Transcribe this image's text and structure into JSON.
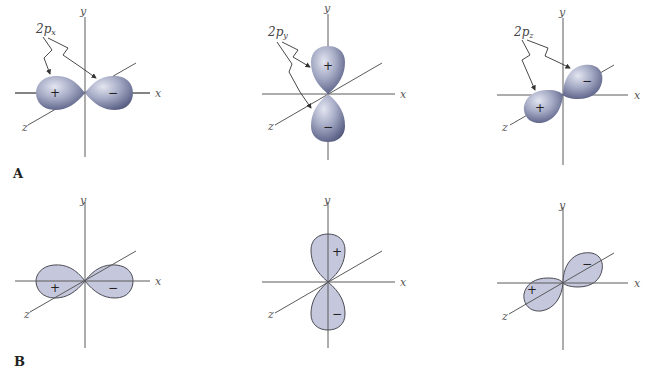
{
  "figure": {
    "rows": [
      {
        "label": "A",
        "style": "shaded-3d",
        "panels": [
          {
            "id": "px",
            "orbital_label": "2p",
            "orbital_sub": "x",
            "axes": {
              "x": "x",
              "y": "y",
              "z": "z"
            },
            "lobes": [
              {
                "sign": "+"
              },
              {
                "sign": "−"
              }
            ]
          },
          {
            "id": "py",
            "orbital_label": "2p",
            "orbital_sub": "y",
            "axes": {
              "x": "x",
              "y": "y",
              "z": "z"
            },
            "lobes": [
              {
                "sign": "+"
              },
              {
                "sign": "−"
              }
            ]
          },
          {
            "id": "pz",
            "orbital_label": "2p",
            "orbital_sub": "z",
            "axes": {
              "x": "x",
              "y": "y",
              "z": "z"
            },
            "lobes": [
              {
                "sign": "+"
              },
              {
                "sign": "−"
              }
            ]
          }
        ]
      },
      {
        "label": "B",
        "style": "flat-outline",
        "panels": [
          {
            "id": "px",
            "axes": {
              "x": "x",
              "y": "y",
              "z": "z"
            },
            "lobes": [
              {
                "sign": "+"
              },
              {
                "sign": "−"
              }
            ]
          },
          {
            "id": "py",
            "axes": {
              "x": "x",
              "y": "y",
              "z": "z"
            },
            "lobes": [
              {
                "sign": "+"
              },
              {
                "sign": "−"
              }
            ]
          },
          {
            "id": "pz",
            "axes": {
              "x": "x",
              "y": "y",
              "z": "z"
            },
            "lobes": [
              {
                "sign": "+"
              },
              {
                "sign": "−"
              }
            ]
          }
        ]
      }
    ],
    "colors": {
      "lobe_light": "#d4d7e6",
      "lobe_mid": "#9ea3be",
      "lobe_dark": "#5c6284",
      "lobe_flat": "#c5c8dc",
      "axis": "#5a5a5a"
    }
  }
}
